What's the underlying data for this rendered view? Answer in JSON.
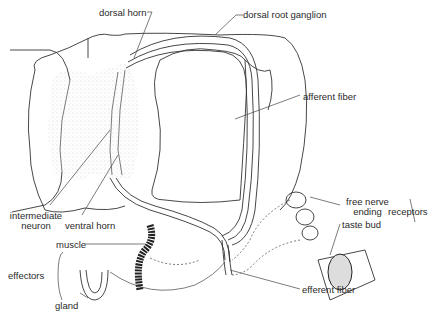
{
  "diagram": {
    "labels": {
      "dorsal_horn": "dorsal horn",
      "dorsal_root_ganglion": "dorsal root ganglion",
      "afferent_fiber": "afferent fiber",
      "intermediate_neuron_1": "intermediate",
      "intermediate_neuron_2": "neuron",
      "ventral_horn": "ventral horn",
      "free_nerve_ending_1": "free nerve",
      "free_nerve_ending_2": "ending",
      "receptors": "receptors",
      "taste_bud": "taste bud",
      "muscle": "muscle",
      "effectors": "effectors",
      "gland": "gland",
      "efferent_fiber": "efferent fiber"
    },
    "colors": {
      "line": "#333333",
      "stipple": "#bdbdbd",
      "background": "#ffffff"
    }
  }
}
